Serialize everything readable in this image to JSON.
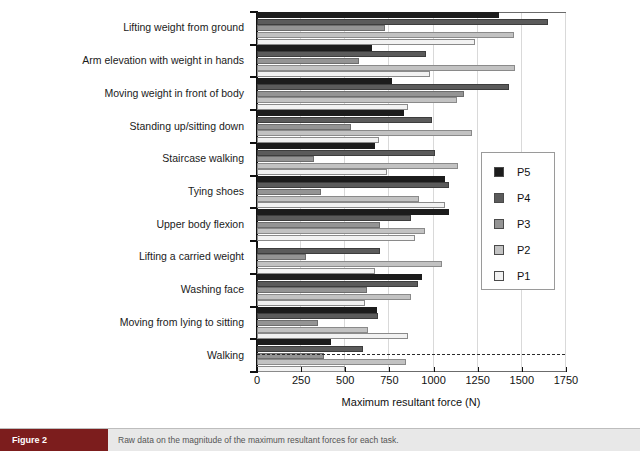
{
  "chart_data": {
    "type": "bar",
    "orientation": "horizontal",
    "title": "",
    "xlabel": "Maximum resultant force (N)",
    "ylabel": "",
    "xlim": [
      0,
      1750
    ],
    "xticks": [
      0,
      250,
      500,
      750,
      1000,
      1250,
      1500,
      1750
    ],
    "grid": true,
    "legend_position": "right-middle",
    "legend_entries": [
      "P5",
      "P4",
      "P3",
      "P2",
      "P1"
    ],
    "series_order_top_to_bottom": [
      "P5",
      "P4",
      "P3",
      "P2",
      "P1"
    ],
    "categories": [
      "Lifting weight from ground",
      "Arm elevation with weight in hands",
      "Moving weight in front of body",
      "Standing up/sitting down",
      "Staircase walking",
      "Tying shoes",
      "Upper body flexion",
      "Lifting a carried weight",
      "Washing face",
      "Moving from lying to sitting",
      "Walking"
    ],
    "series": [
      {
        "name": "P5",
        "color": "#1c1c1c",
        "values": [
          1370,
          650,
          765,
          830,
          670,
          1065,
          1085,
          null,
          935,
          680,
          420
        ]
      },
      {
        "name": "P4",
        "color": "#5b5b5b",
        "values": [
          1650,
          955,
          1430,
          990,
          1010,
          1085,
          870,
          695,
          910,
          685,
          600
        ]
      },
      {
        "name": "P3",
        "color": "#949494",
        "values": [
          725,
          580,
          1175,
          535,
          320,
          365,
          695,
          280,
          625,
          345,
          380
        ]
      },
      {
        "name": "P2",
        "color": "#c2c2c2",
        "values": [
          1455,
          1460,
          1130,
          1215,
          1140,
          920,
          950,
          1050,
          870,
          630,
          845
        ]
      },
      {
        "name": "P1",
        "color": "#f2f2f2",
        "values": [
          1235,
          980,
          855,
          690,
          735,
          1065,
          895,
          670,
          610,
          855,
          500
        ]
      }
    ]
  },
  "caption": {
    "tag": "Figure 2",
    "text": "Raw data on the magnitude of the maximum resultant forces for each task."
  }
}
